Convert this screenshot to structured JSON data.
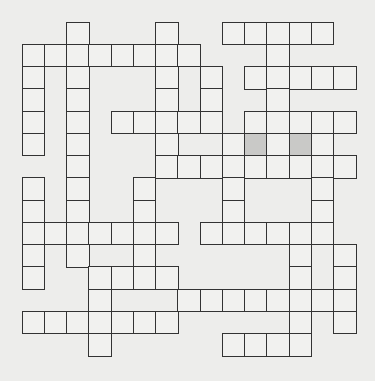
{
  "puzzle": {
    "type": "crossword",
    "rows": 15,
    "cols": 15,
    "cell_size_px": 22.25,
    "origin_px": [
      0,
      0
    ],
    "colors": {
      "background": "#ededeb",
      "cell": "#f1f1ef",
      "shaded_cell": "#c9c9c7",
      "border": "#333333"
    },
    "grid_rows": [
      {
        "row": 1,
        "cols": [
          3,
          7,
          10,
          11,
          12,
          13,
          14
        ]
      },
      {
        "row": 2,
        "cols": [
          1,
          2,
          3,
          4,
          5,
          6,
          7,
          8,
          12
        ]
      },
      {
        "row": 3,
        "cols": [
          1,
          3,
          7,
          9,
          11,
          12,
          13,
          14,
          15
        ]
      },
      {
        "row": 4,
        "cols": [
          1,
          3,
          7,
          9,
          12
        ]
      },
      {
        "row": 5,
        "cols": [
          1,
          3,
          5,
          6,
          7,
          8,
          9,
          11,
          12,
          13,
          14,
          15
        ]
      },
      {
        "row": 6,
        "cols": [
          1,
          3,
          7,
          10,
          11,
          12,
          13,
          14
        ]
      },
      {
        "row": 7,
        "cols": [
          3,
          7,
          8,
          9,
          10,
          11,
          12,
          13,
          14,
          15
        ]
      },
      {
        "row": 8,
        "cols": [
          1,
          3,
          6,
          10,
          14
        ]
      },
      {
        "row": 9,
        "cols": [
          1,
          3,
          6,
          10,
          14
        ]
      },
      {
        "row": 10,
        "cols": [
          1,
          2,
          3,
          4,
          5,
          6,
          7,
          9,
          10,
          11,
          12,
          13,
          14
        ]
      },
      {
        "row": 11,
        "cols": [
          1,
          3,
          6,
          13,
          15
        ]
      },
      {
        "row": 12,
        "cols": [
          1,
          4,
          5,
          6,
          7,
          13,
          15
        ]
      },
      {
        "row": 13,
        "cols": [
          4,
          8,
          9,
          10,
          11,
          12,
          13,
          14,
          15
        ]
      },
      {
        "row": 14,
        "cols": [
          1,
          2,
          3,
          4,
          5,
          6,
          7,
          13,
          15
        ]
      },
      {
        "row": 15,
        "cols": [
          4,
          10,
          11,
          12,
          13
        ]
      }
    ],
    "shaded_cells": [
      [
        6,
        11
      ],
      [
        6,
        13
      ]
    ],
    "cell_letters": {}
  }
}
